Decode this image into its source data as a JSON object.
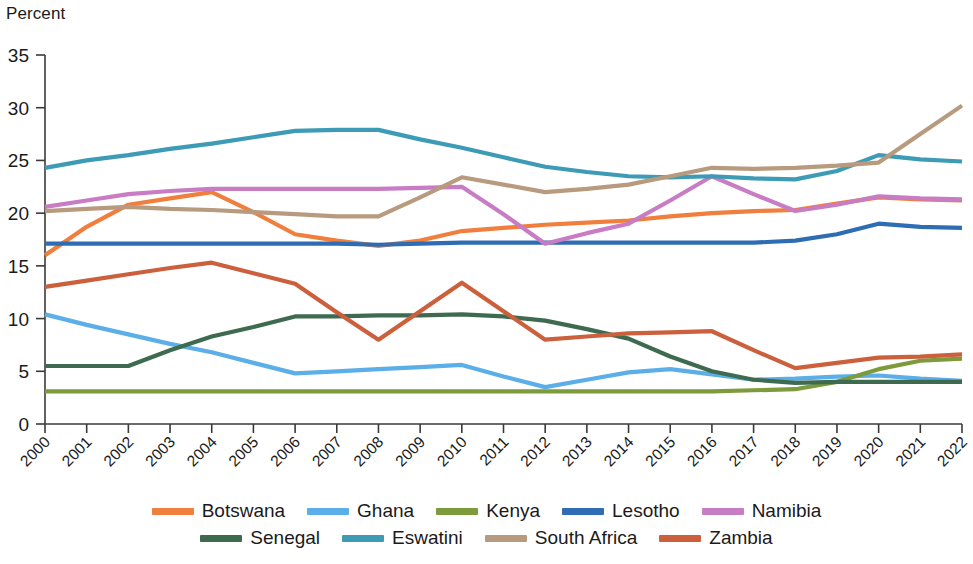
{
  "chart_data": {
    "type": "line",
    "title": "",
    "subtitle": "",
    "xlabel": "",
    "ylabel": "Percent",
    "ylim": [
      0,
      35
    ],
    "yticks": [
      0,
      5,
      10,
      15,
      20,
      25,
      30,
      35
    ],
    "grid": false,
    "legend_position": "bottom",
    "categories": [
      "2000",
      "2001",
      "2002",
      "2003",
      "2004",
      "2005",
      "2006",
      "2007",
      "2008",
      "2009",
      "2010",
      "2011",
      "2012",
      "2013",
      "2014",
      "2015",
      "2016",
      "2017",
      "2018",
      "2019",
      "2020",
      "2021",
      "2022"
    ],
    "series": [
      {
        "name": "Botswana",
        "color": "#F07E3D",
        "values": [
          16.0,
          18.7,
          20.8,
          21.4,
          22.0,
          20.1,
          18.0,
          17.4,
          16.9,
          17.4,
          18.3,
          18.6,
          18.9,
          19.1,
          19.3,
          19.7,
          20.0,
          20.2,
          20.3,
          20.9,
          21.5,
          21.3,
          21.2
        ]
      },
      {
        "name": "Ghana",
        "color": "#5BAEE8",
        "values": [
          10.4,
          9.4,
          8.5,
          7.6,
          6.8,
          5.8,
          4.8,
          5.0,
          5.2,
          5.4,
          5.6,
          4.5,
          3.5,
          4.2,
          4.9,
          5.2,
          4.7,
          4.2,
          4.3,
          4.5,
          4.6,
          4.3,
          4.1
        ]
      },
      {
        "name": "Kenya",
        "color": "#7D9B3C",
        "values": [
          3.1,
          3.1,
          3.1,
          3.1,
          3.1,
          3.1,
          3.1,
          3.1,
          3.1,
          3.1,
          3.1,
          3.1,
          3.1,
          3.1,
          3.1,
          3.1,
          3.1,
          3.2,
          3.3,
          4.0,
          5.2,
          6.0,
          6.2
        ]
      },
      {
        "name": "Lesotho",
        "color": "#2E6DB4",
        "values": [
          17.1,
          17.1,
          17.1,
          17.1,
          17.1,
          17.1,
          17.1,
          17.1,
          17.0,
          17.1,
          17.2,
          17.2,
          17.2,
          17.2,
          17.2,
          17.2,
          17.2,
          17.2,
          17.4,
          18.0,
          19.0,
          18.7,
          18.6
        ]
      },
      {
        "name": "Namibia",
        "color": "#C77CC4",
        "values": [
          20.6,
          21.2,
          21.8,
          22.1,
          22.3,
          22.3,
          22.3,
          22.3,
          22.3,
          22.4,
          22.5,
          19.9,
          17.1,
          18.1,
          19.0,
          21.2,
          23.5,
          21.8,
          20.2,
          20.8,
          21.6,
          21.4,
          21.3
        ]
      },
      {
        "name": "Senegal",
        "color": "#3E6B4F",
        "values": [
          5.5,
          5.5,
          5.5,
          7.0,
          8.3,
          9.2,
          10.2,
          10.2,
          10.3,
          10.3,
          10.4,
          10.2,
          9.8,
          9.0,
          8.1,
          6.4,
          5.0,
          4.2,
          3.9,
          4.0,
          4.0,
          4.0,
          4.0
        ]
      },
      {
        "name": "Eswatini",
        "color": "#3D9BB5",
        "values": [
          24.3,
          25.0,
          25.5,
          26.1,
          26.6,
          27.2,
          27.8,
          27.9,
          27.9,
          27.0,
          26.2,
          25.3,
          24.4,
          23.9,
          23.5,
          23.4,
          23.5,
          23.3,
          23.2,
          24.0,
          25.5,
          25.1,
          24.9
        ]
      },
      {
        "name": "South Africa",
        "color": "#B89A7E",
        "values": [
          20.2,
          20.4,
          20.6,
          20.4,
          20.3,
          20.1,
          19.9,
          19.7,
          19.7,
          21.5,
          23.4,
          22.7,
          22.0,
          22.3,
          22.7,
          23.5,
          24.3,
          24.2,
          24.3,
          24.5,
          24.8,
          27.5,
          30.2
        ]
      },
      {
        "name": "Zambia",
        "color": "#CC5F3C",
        "values": [
          13.0,
          13.6,
          14.2,
          14.8,
          15.3,
          14.3,
          13.3,
          10.6,
          8.0,
          10.7,
          13.4,
          10.7,
          8.0,
          8.3,
          8.6,
          8.7,
          8.8,
          7.0,
          5.3,
          5.8,
          6.3,
          6.4,
          6.6
        ]
      }
    ]
  },
  "legend": {
    "rows": [
      [
        {
          "label": "Botswana",
          "color": "#F07E3D"
        },
        {
          "label": "Ghana",
          "color": "#5BAEE8"
        },
        {
          "label": "Kenya",
          "color": "#7D9B3C"
        },
        {
          "label": "Lesotho",
          "color": "#2E6DB4"
        },
        {
          "label": "Namibia",
          "color": "#C77CC4"
        }
      ],
      [
        {
          "label": "Senegal",
          "color": "#3E6B4F"
        },
        {
          "label": "Eswatini",
          "color": "#3D9BB5"
        },
        {
          "label": "South Africa",
          "color": "#B89A7E"
        },
        {
          "label": "Zambia",
          "color": "#CC5F3C"
        }
      ]
    ]
  }
}
